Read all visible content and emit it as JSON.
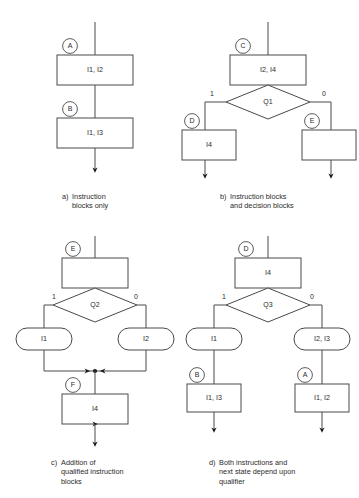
{
  "figure": {
    "panels": [
      {
        "id": "a",
        "caption_tag": "a)",
        "caption_lines": [
          "Instruction",
          "blocks only"
        ],
        "nodes": [
          {
            "kind": "instruction-block",
            "state": "A",
            "text": "I1, I2"
          },
          {
            "kind": "instruction-block",
            "state": "B",
            "text": "I1, I3"
          }
        ],
        "branch_labels": []
      },
      {
        "id": "b",
        "caption_tag": "b)",
        "caption_lines": [
          "Instruction blocks",
          "and decision blocks"
        ],
        "nodes": [
          {
            "kind": "instruction-block",
            "state": "C",
            "text": "I2, I4"
          },
          {
            "kind": "decision-block",
            "text": "Q1"
          },
          {
            "kind": "instruction-block",
            "state": "D",
            "text": "I4"
          },
          {
            "kind": "instruction-block",
            "state": "E",
            "text": ""
          }
        ],
        "branch_labels": [
          "1",
          "0"
        ]
      },
      {
        "id": "c",
        "caption_tag": "c)",
        "caption_lines": [
          "Addition of",
          "qualified instruction",
          "blocks"
        ],
        "nodes": [
          {
            "kind": "instruction-block",
            "state": "E",
            "text": ""
          },
          {
            "kind": "decision-block",
            "text": "Q2"
          },
          {
            "kind": "qualified-instruction-block",
            "text": "I1"
          },
          {
            "kind": "qualified-instruction-block",
            "text": "I2"
          },
          {
            "kind": "instruction-block",
            "state": "F",
            "text": "I4"
          }
        ],
        "branch_labels": [
          "1",
          "0"
        ]
      },
      {
        "id": "d",
        "caption_tag": "d)",
        "caption_lines": [
          "Both instructions and",
          "next state depend upon",
          "qualifier"
        ],
        "nodes": [
          {
            "kind": "instruction-block",
            "state": "D",
            "text": "I4"
          },
          {
            "kind": "decision-block",
            "text": "Q3"
          },
          {
            "kind": "qualified-instruction-block",
            "text": "I1"
          },
          {
            "kind": "qualified-instruction-block",
            "text": "I2, I3"
          },
          {
            "kind": "instruction-block",
            "state": "B",
            "text": "I1, I3"
          },
          {
            "kind": "instruction-block",
            "state": "A",
            "text": "I1, I2"
          }
        ],
        "branch_labels": [
          "1",
          "0"
        ]
      }
    ],
    "colors": {
      "stroke": "#4a4a4a",
      "text": "#2b2b2b",
      "background": "#ffffff",
      "marker": "#1a1a1a"
    }
  }
}
